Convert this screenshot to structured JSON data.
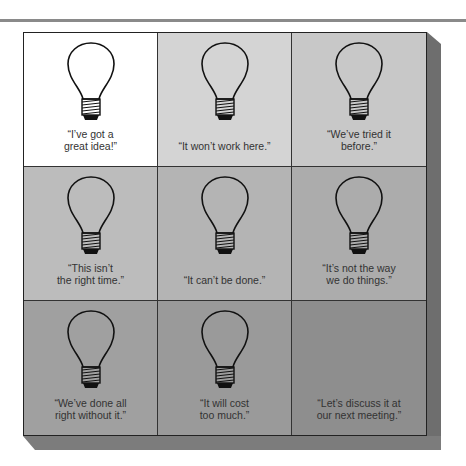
{
  "figure": {
    "grid": {
      "rows": 3,
      "cols": 3
    },
    "cells": [
      {
        "quote": "“I’ve got a\ngreat idea!”",
        "lines": [
          "“I’ve got a",
          "great idea!”"
        ],
        "has_bulb": true,
        "bg": "#ffffff"
      },
      {
        "quote": "“It won’t work here.”",
        "lines": [
          "“It won’t work here.”"
        ],
        "has_bulb": true,
        "bg": "#d4d4d4"
      },
      {
        "quote": "“We’ve tried it before.”",
        "lines": [
          "“We’ve tried it",
          "before.”"
        ],
        "has_bulb": true,
        "bg": "#c8c8c8"
      },
      {
        "quote": "“This isn’t the right time.”",
        "lines": [
          "“This isn’t",
          "the right time.”"
        ],
        "has_bulb": true,
        "bg": "#bcbcbc"
      },
      {
        "quote": "“It can’t be done.”",
        "lines": [
          "“It can’t be done.”"
        ],
        "has_bulb": true,
        "bg": "#b4b4b4"
      },
      {
        "quote": "“It’s not the way we do things.”",
        "lines": [
          "“It’s not the way",
          "we do things.”"
        ],
        "has_bulb": true,
        "bg": "#acacac"
      },
      {
        "quote": "“We’ve done all right without it.”",
        "lines": [
          "“We’ve done all",
          "right without it.”"
        ],
        "has_bulb": true,
        "bg": "#a0a0a0"
      },
      {
        "quote": "“It will cost too much.”",
        "lines": [
          "“It will cost",
          "too much.”"
        ],
        "has_bulb": true,
        "bg": "#9a9a9a"
      },
      {
        "quote": "“Let’s discuss it at our next meeting.”",
        "lines": [
          "“Let’s discuss it at",
          "our next meeting.”"
        ],
        "has_bulb": false,
        "bg": "#8e8e8e"
      }
    ],
    "icon": "light-bulb-icon"
  }
}
